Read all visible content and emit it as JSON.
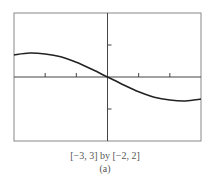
{
  "chart_data": {
    "type": "line",
    "title": "",
    "xlabel": "",
    "ylabel": "",
    "xlim": [
      -3,
      3
    ],
    "ylim": [
      -2,
      2
    ],
    "x_ticks": [
      -2,
      -1,
      0,
      1,
      2
    ],
    "y_ticks": [
      -1,
      0,
      1
    ],
    "grid": false,
    "legend": null,
    "series": [
      {
        "name": "f(x)",
        "x": [
          -3,
          -2.5,
          -2,
          -1.5,
          -1,
          -0.5,
          0,
          0.5,
          1,
          1.5,
          2,
          2.5,
          3
        ],
        "y": [
          0.69,
          0.75,
          0.72,
          0.63,
          0.46,
          0.24,
          0,
          -0.24,
          -0.46,
          -0.63,
          -0.72,
          -0.75,
          -0.69
        ]
      }
    ],
    "window_caption": "[−3, 3] by [−2, 2]",
    "subfigure_label": "(a)"
  },
  "caption": {
    "window": "[−3, 3] by [−2, 2]",
    "label": "(a)"
  },
  "colors": {
    "frame": "#888888",
    "axes": "#444444",
    "curve": "#222222",
    "caption": "#555555"
  }
}
